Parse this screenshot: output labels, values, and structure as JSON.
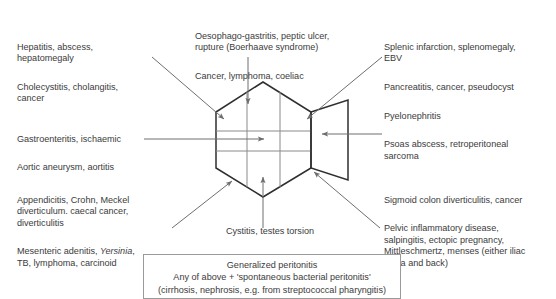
{
  "diagram": {
    "shape_labels": {
      "abdomen": "abdomen-hexagon",
      "back": "back-trapezoid"
    },
    "line_color": "#2f2f2f",
    "arrow_color": "#6e6e6e",
    "text_color": "#3b3b3b"
  },
  "labels": {
    "top_left": {
      "name": "right-upper-quadrant-causes",
      "paragraphs": [
        "Hepatitis, abscess,\nhepatomegaly",
        "Cholecystitis, cholangitis,\ncancer"
      ]
    },
    "top_center": {
      "name": "epigastric-causes",
      "paragraphs": [
        "Oesophago-gastritis, peptic ulcer,\nrupture (Boerhaave syndrome)",
        "Cancer, lymphoma, coeliac"
      ]
    },
    "top_right": {
      "name": "left-upper-quadrant-causes",
      "paragraphs": [
        "Splenic infarction, splenomegaly,\nEBV",
        "Pancreatitis, cancer, pseudocyst"
      ]
    },
    "mid_left": {
      "name": "central-abdomen-causes",
      "paragraphs": [
        "Gastroenteritis, ischaemic",
        "Aortic aneurysm, aortitis"
      ]
    },
    "mid_right": {
      "name": "loin-back-causes",
      "paragraphs": [
        "Pyelonephritis",
        "Psoas abscess, retroperitoneal\nsarcoma"
      ]
    },
    "bottom_left": {
      "name": "right-iliac-fossa-causes",
      "paragraphs": [
        "Appendicitis, Crohn, Meckel\ndiverticulum. caecal cancer,\ndiverticulitis",
        "Mesenteric adenitis, "
      ],
      "italic_word": "Yersinia",
      "after_italic": ",\nTB, lymphoma, carcinoid"
    },
    "bottom_center": {
      "name": "suprapubic-causes",
      "paragraphs": [
        "Cystitis, testes torsion"
      ]
    },
    "bottom_right": {
      "name": "left-iliac-fossa-causes",
      "paragraphs": [
        "Sigmoid colon diverticulitis, cancer",
        "Pelvic inflammatory disease,\nsalpingitis, ectopic pregnancy,\nMittleschmertz, menses (either iliac\nfossa and back)"
      ]
    }
  },
  "peritonitis_box": {
    "name": "generalized-peritonitis-box",
    "lines": [
      "Generalized peritonitis",
      "Any of above + 'spontaneous bacterial peritonitis'",
      "(cirrhosis, nephrosis, e.g. from streptococcal pharyngitis)"
    ]
  }
}
